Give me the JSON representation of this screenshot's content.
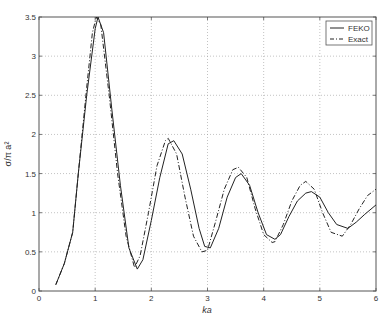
{
  "chart_data": {
    "type": "line",
    "title": "",
    "xlabel": "ka",
    "ylabel": "σ/π a²",
    "xlim": [
      0,
      6
    ],
    "ylim": [
      0,
      3.5
    ],
    "xticks": [
      "0",
      "1",
      "2",
      "3",
      "4",
      "5",
      "6"
    ],
    "yticks": [
      "0",
      "0.5",
      "1",
      "1.5",
      "2",
      "2.5",
      "3",
      "3.5"
    ],
    "grid": true,
    "legend_position": "upper right",
    "series": [
      {
        "name": "FEKO",
        "style": "solid",
        "x": [
          0.3,
          0.45,
          0.6,
          0.7,
          0.85,
          1.0,
          1.05,
          1.15,
          1.3,
          1.45,
          1.6,
          1.75,
          1.85,
          2.0,
          2.15,
          2.3,
          2.4,
          2.55,
          2.7,
          2.85,
          2.95,
          3.05,
          3.2,
          3.35,
          3.5,
          3.6,
          3.75,
          3.9,
          4.05,
          4.2,
          4.3,
          4.45,
          4.6,
          4.75,
          4.85,
          5.0,
          5.15,
          5.3,
          5.5,
          5.65,
          5.8,
          6.0
        ],
        "y": [
          0.08,
          0.35,
          0.75,
          1.5,
          2.5,
          3.35,
          3.5,
          3.3,
          2.3,
          1.35,
          0.55,
          0.28,
          0.4,
          0.9,
          1.45,
          1.88,
          1.92,
          1.75,
          1.3,
          0.8,
          0.57,
          0.55,
          0.8,
          1.2,
          1.45,
          1.5,
          1.35,
          1.0,
          0.72,
          0.66,
          0.72,
          0.95,
          1.15,
          1.25,
          1.27,
          1.2,
          1.0,
          0.85,
          0.8,
          0.88,
          0.98,
          1.1
        ]
      },
      {
        "name": "Exact",
        "style": "dash-dot",
        "x": [
          0.3,
          0.45,
          0.6,
          0.7,
          0.85,
          0.95,
          1.02,
          1.1,
          1.25,
          1.4,
          1.55,
          1.7,
          1.8,
          1.95,
          2.1,
          2.25,
          2.3,
          2.45,
          2.6,
          2.75,
          2.9,
          3.0,
          3.15,
          3.3,
          3.45,
          3.55,
          3.7,
          3.85,
          4.0,
          4.15,
          4.2,
          4.35,
          4.5,
          4.65,
          4.75,
          4.9,
          5.05,
          5.2,
          5.4,
          5.55,
          5.7,
          5.85,
          6.0
        ],
        "y": [
          0.08,
          0.35,
          0.75,
          1.5,
          2.6,
          3.3,
          3.5,
          3.4,
          2.5,
          1.5,
          0.7,
          0.3,
          0.45,
          1.0,
          1.6,
          1.92,
          1.95,
          1.75,
          1.2,
          0.7,
          0.5,
          0.52,
          0.9,
          1.3,
          1.55,
          1.58,
          1.45,
          1.05,
          0.72,
          0.62,
          0.63,
          0.85,
          1.15,
          1.35,
          1.4,
          1.3,
          1.0,
          0.75,
          0.7,
          0.85,
          1.05,
          1.22,
          1.3
        ]
      }
    ]
  },
  "legend": {
    "items": [
      {
        "label": "FEKO",
        "style": "solid"
      },
      {
        "label": "Exact",
        "style": "dash-dot"
      }
    ]
  },
  "colors": {
    "line": "#222222",
    "axis": "#555555",
    "grid": "#9a9a9a",
    "background": "#ffffff"
  }
}
